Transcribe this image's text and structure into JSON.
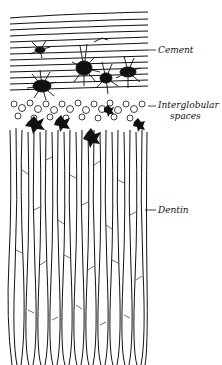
{
  "figure": {
    "labels": {
      "cement": "Cement",
      "interglobular_line1": "Interglobular",
      "interglobular_line2": "spaces",
      "dentin": "Dentin"
    },
    "colors": {
      "ink": "#111111",
      "paper": "#ffffff"
    }
  }
}
